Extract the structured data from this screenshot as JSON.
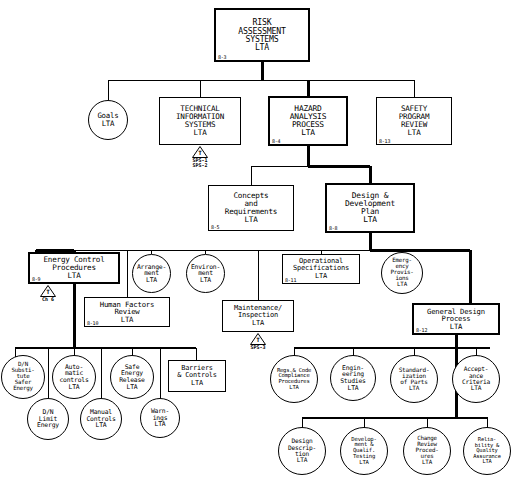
{
  "diagram": {
    "nodes": [
      {
        "id": "risk",
        "label": "RISK\nASSESSMENT\nSYSTEMS\nLTA",
        "code": "8-3",
        "shape": "rect",
        "bold": true,
        "x": 214,
        "y": 8,
        "w": 96,
        "h": 54,
        "fs": 8.2
      },
      {
        "id": "goals",
        "label": "Goals\nLTA",
        "code": "",
        "shape": "circle",
        "bold": false,
        "x": 88,
        "y": 100,
        "w": 40,
        "h": 40,
        "fs": 7.4
      },
      {
        "id": "tech",
        "label": "TECHNICAL\nINFORMATION\nSYSTEMS\nLTA",
        "code": "",
        "shape": "rect",
        "bold": false,
        "x": 159,
        "y": 97,
        "w": 82,
        "h": 48,
        "fs": 7.6
      },
      {
        "id": "hazard",
        "label": "HAZARD\nANALYSIS\nPROCESS\nLTA",
        "code": "8-4",
        "shape": "rect",
        "bold": true,
        "x": 268,
        "y": 96,
        "w": 80,
        "h": 50,
        "fs": 7.9
      },
      {
        "id": "safety",
        "label": "SAFETY\nPROGRAM\nREVIEW\nLTA",
        "code": "8-13",
        "shape": "rect",
        "bold": false,
        "x": 376,
        "y": 97,
        "w": 76,
        "h": 48,
        "fs": 7.6
      },
      {
        "id": "concepts",
        "label": "Concepts\nand\nRequirements\nLTA",
        "code": "8-5",
        "shape": "rect",
        "bold": false,
        "x": 208,
        "y": 185,
        "w": 86,
        "h": 46,
        "fs": 7.6
      },
      {
        "id": "design",
        "label": "Design &\nDevelopment\nPlan\nLTA",
        "code": "8-8",
        "shape": "rect",
        "bold": true,
        "x": 325,
        "y": 183,
        "w": 90,
        "h": 50,
        "fs": 7.9
      },
      {
        "id": "energy",
        "label": "Energy Control\nProcedures\nLTA",
        "code": "8-9",
        "shape": "rect",
        "bold": true,
        "x": 28,
        "y": 252,
        "w": 92,
        "h": 32,
        "fs": 7.6
      },
      {
        "id": "arrange",
        "label": "Arrange-\nment\nLTA",
        "code": "",
        "shape": "circle",
        "bold": false,
        "x": 132,
        "y": 254,
        "w": 39,
        "h": 39,
        "fs": 6.4
      },
      {
        "id": "environ",
        "label": "Environ-\nment\nLTA",
        "code": "",
        "shape": "circle",
        "bold": false,
        "x": 186,
        "y": 254,
        "w": 39,
        "h": 39,
        "fs": 6.4
      },
      {
        "id": "opspec",
        "label": "Operational\nSpecifications\nLTA",
        "code": "8-11",
        "shape": "rect",
        "bold": false,
        "x": 282,
        "y": 254,
        "w": 78,
        "h": 30,
        "fs": 7.0
      },
      {
        "id": "emerg",
        "label": "Emerg-\nency\nProvis-\nions\nLTA",
        "code": "",
        "shape": "circle",
        "bold": false,
        "x": 381,
        "y": 252,
        "w": 42,
        "h": 42,
        "fs": 5.8
      },
      {
        "id": "human",
        "label": "Human Factors\nReview\nLTA",
        "code": "8-10",
        "shape": "rect",
        "bold": false,
        "x": 84,
        "y": 297,
        "w": 86,
        "h": 30,
        "fs": 7.3
      },
      {
        "id": "maint",
        "label": "Maintenance/\nInspection\nLTA",
        "code": "",
        "shape": "rect",
        "bold": false,
        "x": 222,
        "y": 300,
        "w": 72,
        "h": 32,
        "fs": 7.0
      },
      {
        "id": "gendesign",
        "label": "General Design\nProcess\nLTA",
        "code": "8-12",
        "shape": "rect",
        "bold": true,
        "x": 412,
        "y": 303,
        "w": 88,
        "h": 32,
        "fs": 7.2
      },
      {
        "id": "dnsub",
        "label": "D/N\nSubsti-\ntute\nSafer\nEnergy",
        "code": "",
        "shape": "circle",
        "bold": false,
        "x": 1,
        "y": 355,
        "w": 44,
        "h": 44,
        "fs": 5.8
      },
      {
        "id": "dnlimit",
        "label": "D/N\nLimit\nEnergy",
        "code": "",
        "shape": "circle",
        "bold": false,
        "x": 27,
        "y": 398,
        "w": 42,
        "h": 42,
        "fs": 6.4
      },
      {
        "id": "auto",
        "label": "Auto-\nmatic\ncontrols\nLTA",
        "code": "",
        "shape": "circle",
        "bold": false,
        "x": 52,
        "y": 355,
        "w": 44,
        "h": 44,
        "fs": 6.4
      },
      {
        "id": "manual",
        "label": "Manual\nControls\nLTA",
        "code": "",
        "shape": "circle",
        "bold": false,
        "x": 80,
        "y": 398,
        "w": 42,
        "h": 42,
        "fs": 6.4
      },
      {
        "id": "saferel",
        "label": "Safe\nEnergy\nRelease\nLTA",
        "code": "",
        "shape": "circle",
        "bold": false,
        "x": 110,
        "y": 355,
        "w": 44,
        "h": 44,
        "fs": 6.4
      },
      {
        "id": "warn",
        "label": "Warn-\nings\nLTA",
        "code": "",
        "shape": "circle",
        "bold": false,
        "x": 140,
        "y": 398,
        "w": 40,
        "h": 40,
        "fs": 6.4
      },
      {
        "id": "barriers",
        "label": "Barriers\n& Controls\nLTA",
        "code": "",
        "shape": "rect",
        "bold": false,
        "x": 168,
        "y": 360,
        "w": 58,
        "h": 32,
        "fs": 6.9
      },
      {
        "id": "regs",
        "label": "Regs.& Code\nCompliance\nProcedures\nLTA",
        "code": "",
        "shape": "circle",
        "bold": false,
        "x": 270,
        "y": 355,
        "w": 48,
        "h": 48,
        "fs": 5.5
      },
      {
        "id": "engstud",
        "label": "Engin-\neering\nStudies\nLTA",
        "code": "",
        "shape": "circle",
        "bold": false,
        "x": 330,
        "y": 355,
        "w": 46,
        "h": 46,
        "fs": 6.4
      },
      {
        "id": "standard",
        "label": "Standard-\nization\nof Parts\nLTA",
        "code": "",
        "shape": "circle",
        "bold": false,
        "x": 390,
        "y": 355,
        "w": 48,
        "h": 48,
        "fs": 6.0
      },
      {
        "id": "accept",
        "label": "Accept-\nance\nCriteria\nLTA",
        "code": "",
        "shape": "circle",
        "bold": false,
        "x": 452,
        "y": 355,
        "w": 48,
        "h": 48,
        "fs": 6.2
      },
      {
        "id": "desdesc",
        "label": "Design\nDescrip-\ntion\nLTA",
        "code": "",
        "shape": "circle",
        "bold": false,
        "x": 278,
        "y": 427,
        "w": 48,
        "h": 48,
        "fs": 6.2
      },
      {
        "id": "devqual",
        "label": "Develop-\nment &\nQualif.\nTesting\nLTA",
        "code": "",
        "shape": "circle",
        "bold": false,
        "x": 340,
        "y": 427,
        "w": 48,
        "h": 48,
        "fs": 5.6
      },
      {
        "id": "change",
        "label": "Change\nReview\nProced-\nures\nLTA",
        "code": "",
        "shape": "circle",
        "bold": false,
        "x": 403,
        "y": 427,
        "w": 48,
        "h": 48,
        "fs": 5.8
      },
      {
        "id": "relqa",
        "label": "Relia-\nbility &\nQuality\nAssurance\nLTA",
        "code": "",
        "shape": "circle",
        "bold": false,
        "x": 463,
        "y": 427,
        "w": 48,
        "h": 48,
        "fs": 5.4
      }
    ],
    "transfers": [
      {
        "id": "tech-transfer",
        "letter": "T",
        "sub": "SPS-1\nSPS-2",
        "x": 192,
        "y": 146
      },
      {
        "id": "energy-transfer",
        "letter": "T",
        "sub": "Ch 6",
        "x": 40,
        "y": 285
      },
      {
        "id": "maint-transfer",
        "letter": "T",
        "sub": "SPS-3",
        "x": 250,
        "y": 333
      }
    ],
    "edges": [
      {
        "from": "risk",
        "to": "tier2-bus"
      },
      {
        "from": "tier2-bus",
        "to": "goals"
      },
      {
        "from": "tier2-bus",
        "to": "tech"
      },
      {
        "from": "tier2-bus",
        "to": "hazard"
      },
      {
        "from": "tier2-bus",
        "to": "safety"
      },
      {
        "from": "hazard",
        "to": "concepts"
      },
      {
        "from": "hazard",
        "to": "design"
      },
      {
        "from": "design",
        "to": "tier4-bus"
      },
      {
        "from": "tier4-bus",
        "to": "energy"
      },
      {
        "from": "tier4-bus",
        "to": "arrange"
      },
      {
        "from": "tier4-bus",
        "to": "environ"
      },
      {
        "from": "tier4-bus",
        "to": "human"
      },
      {
        "from": "tier4-bus",
        "to": "opspec"
      },
      {
        "from": "tier4-bus",
        "to": "emerg"
      },
      {
        "from": "tier4-bus",
        "to": "maint"
      },
      {
        "from": "tier4-bus",
        "to": "gendesign"
      },
      {
        "from": "energy",
        "to": "energy-bus"
      },
      {
        "from": "energy-bus",
        "to": "dnsub"
      },
      {
        "from": "energy-bus",
        "to": "dnlimit"
      },
      {
        "from": "energy-bus",
        "to": "auto"
      },
      {
        "from": "energy-bus",
        "to": "manual"
      },
      {
        "from": "energy-bus",
        "to": "saferel"
      },
      {
        "from": "energy-bus",
        "to": "warn"
      },
      {
        "from": "energy-bus",
        "to": "barriers"
      },
      {
        "from": "gendesign",
        "to": "gd-bus1"
      },
      {
        "from": "gd-bus1",
        "to": "regs"
      },
      {
        "from": "gd-bus1",
        "to": "engstud"
      },
      {
        "from": "gd-bus1",
        "to": "standard"
      },
      {
        "from": "gd-bus1",
        "to": "accept"
      },
      {
        "from": "gendesign",
        "to": "gd-bus2"
      },
      {
        "from": "gd-bus2",
        "to": "desdesc"
      },
      {
        "from": "gd-bus2",
        "to": "devqual"
      },
      {
        "from": "gd-bus2",
        "to": "change"
      },
      {
        "from": "gd-bus2",
        "to": "relqa"
      }
    ]
  },
  "style": {
    "line_color": "#000000",
    "bold_line_color": "#000000",
    "background": "#ffffff"
  }
}
